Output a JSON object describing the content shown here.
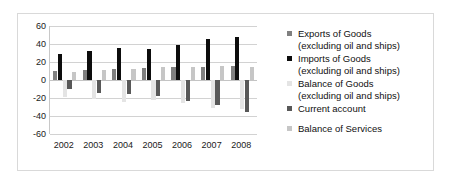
{
  "chart_data": {
    "type": "bar",
    "title": "",
    "xlabel": "",
    "ylabel": "",
    "categories": [
      "2002",
      "2003",
      "2004",
      "2005",
      "2006",
      "2007",
      "2008"
    ],
    "ylim": [
      -60,
      60
    ],
    "yticks": [
      60,
      40,
      20,
      0,
      -20,
      -40,
      -60
    ],
    "grid": true,
    "legend_position": "right",
    "series": [
      {
        "name": "Exports of Goods (excluding oil and ships)",
        "color": "#808080",
        "values": [
          10,
          11,
          12,
          13,
          14,
          15,
          16
        ]
      },
      {
        "name": "Imports of Goods (excluding oil and ships)",
        "color": "#0d0d0d",
        "values": [
          29,
          32,
          36,
          35,
          39,
          46,
          48
        ]
      },
      {
        "name": "Balance of Goods (excluding oil and ships)",
        "color": "#e4e4e4",
        "values": [
          -19,
          -21,
          -24,
          -22,
          -25,
          -31,
          -32
        ]
      },
      {
        "name": "Current account",
        "color": "#585858",
        "values": [
          -10,
          -14,
          -15,
          -18,
          -23,
          -28,
          -36
        ]
      },
      {
        "name": "Balance of Services",
        "color": "#c6c6c6",
        "values": [
          9,
          11,
          12,
          14,
          15,
          16,
          15
        ]
      }
    ]
  },
  "legend": {
    "items": [
      {
        "line1": "Exports of Goods",
        "line2": "(excluding oil and ships)",
        "swatch": "#808080"
      },
      {
        "line1": "Imports of Goods",
        "line2": "(excluding oil and ships)",
        "swatch": "#0d0d0d"
      },
      {
        "line1": "Balance of Goods",
        "line2": "(excluding oil and ships)",
        "swatch": "#e4e4e4"
      },
      {
        "line1": "Current account",
        "line2": "",
        "swatch": "#585858"
      },
      {
        "line1": "Balance of Services",
        "line2": "",
        "swatch": "#c6c6c6"
      }
    ]
  }
}
